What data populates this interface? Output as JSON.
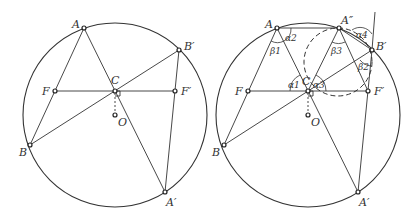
{
  "figures": [
    {
      "id": "left",
      "circle": {
        "cx": 115,
        "cy": 115,
        "r": 92
      },
      "points": {
        "A": {
          "label": "A",
          "x": 84,
          "y": 28,
          "lx": 72,
          "ly": 28
        },
        "B'": {
          "label": "B′",
          "x": 179,
          "y": 50,
          "lx": 184,
          "ly": 50
        },
        "C": {
          "label": "C",
          "x": 115,
          "y": 91,
          "lx": 111,
          "ly": 84
        },
        "F": {
          "label": "F",
          "x": 55,
          "y": 91,
          "lx": 42,
          "ly": 95
        },
        "F'": {
          "label": "F′",
          "x": 175,
          "y": 91,
          "lx": 181,
          "ly": 95
        },
        "O": {
          "label": "O",
          "x": 115,
          "y": 115,
          "lx": 118,
          "ly": 126
        },
        "B": {
          "label": "B",
          "x": 30,
          "y": 145,
          "lx": 19,
          "ly": 156
        },
        "A'": {
          "label": "A′",
          "x": 165,
          "y": 192,
          "lx": 166,
          "ly": 206
        }
      }
    },
    {
      "id": "right",
      "circle": {
        "cx": 308,
        "cy": 115,
        "r": 92
      },
      "points": {
        "A": {
          "label": "A",
          "x": 277,
          "y": 28,
          "lx": 265,
          "ly": 28
        },
        "A''": {
          "label": "A″",
          "x": 339,
          "y": 28,
          "lx": 341,
          "ly": 24
        },
        "B'": {
          "label": "B′",
          "x": 372,
          "y": 50,
          "lx": 376,
          "ly": 50
        },
        "C": {
          "label": "C",
          "x": 308,
          "y": 91,
          "lx": 302,
          "ly": 85
        },
        "F": {
          "label": "F",
          "x": 248,
          "y": 91,
          "lx": 235,
          "ly": 95
        },
        "F'": {
          "label": "F′",
          "x": 368,
          "y": 91,
          "lx": 374,
          "ly": 95
        },
        "O": {
          "label": "O",
          "x": 308,
          "y": 115,
          "lx": 311,
          "ly": 126
        },
        "B": {
          "label": "B",
          "x": 224,
          "y": 145,
          "lx": 212,
          "ly": 156
        },
        "A'": {
          "label": "A′",
          "x": 358,
          "y": 192,
          "lx": 359,
          "ly": 206
        }
      },
      "angles": [
        {
          "label": "α2",
          "x": 287,
          "y": 40
        },
        {
          "label": "β1",
          "x": 270,
          "y": 52
        },
        {
          "label": "α1",
          "x": 289,
          "y": 86
        },
        {
          "label": "α3",
          "x": 313,
          "y": 86
        },
        {
          "label": "β3",
          "x": 332,
          "y": 52
        },
        {
          "label": "α4",
          "x": 358,
          "y": 37
        },
        {
          "label": "β2",
          "x": 359,
          "y": 68
        }
      ]
    }
  ]
}
